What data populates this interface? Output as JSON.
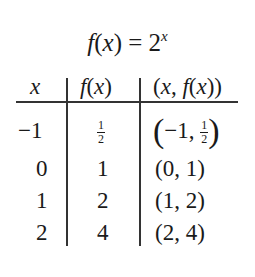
{
  "title": {
    "lhs": "f(x) = 2",
    "exponent": "x"
  },
  "table": {
    "headers": [
      "x",
      "f(x)",
      "(x, f(x))"
    ],
    "rows": [
      {
        "x": "−1",
        "fx_num": "1",
        "fx_den": "2",
        "pair_x": "−1",
        "pair_num": "1",
        "pair_den": "2"
      },
      {
        "x": "0",
        "fx": "1",
        "pair": "(0, 1)"
      },
      {
        "x": "1",
        "fx": "2",
        "pair": "(1, 2)"
      },
      {
        "x": "2",
        "fx": "4",
        "pair": "(2, 4)"
      }
    ]
  }
}
